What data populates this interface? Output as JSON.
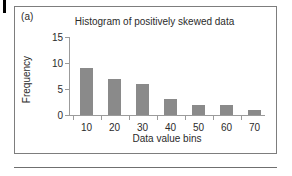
{
  "figure": {
    "panel_label": "(a)"
  },
  "chart_data": {
    "type": "bar",
    "title": "Histogram of positively skewed data",
    "xlabel": "Data value bins",
    "ylabel": "Frequency",
    "categories": [
      "10",
      "20",
      "30",
      "40",
      "50",
      "60",
      "70"
    ],
    "values": [
      9,
      7,
      6,
      3,
      2,
      2,
      1
    ],
    "ylim": [
      0,
      15
    ],
    "yticks": [
      0,
      5,
      10,
      15
    ],
    "ytick_labels": [
      "0",
      "5",
      "10",
      "15"
    ],
    "xtick_labels": [
      "10",
      "20",
      "30",
      "40",
      "50",
      "60",
      "70"
    ],
    "grid": false,
    "legend": null,
    "bar_color": "#8a8a8a",
    "axis_color": "#9b9b9b"
  }
}
